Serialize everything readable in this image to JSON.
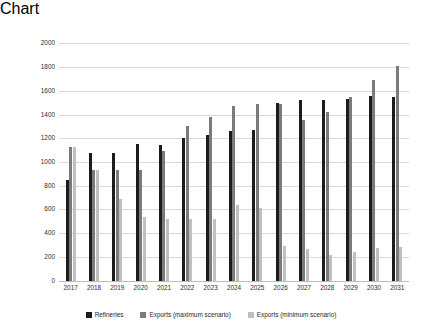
{
  "chart_data": {
    "type": "bar",
    "title": "",
    "subtitle": "",
    "xlabel": "",
    "ylabel": "Thousands of Barrels Per Day",
    "ylim": [
      0,
      2000
    ],
    "ytick_step": 200,
    "yticks": [
      "2000",
      "1800",
      "1600",
      "1400",
      "1200",
      "1000",
      "800",
      "600",
      "400",
      "200",
      "0"
    ],
    "grid": true,
    "legend_position": "bottom",
    "categories": [
      "2017",
      "2018",
      "2019",
      "2020",
      "2021",
      "2022",
      "2023",
      "2024",
      "2025",
      "2026",
      "2027",
      "2028",
      "2029",
      "2030",
      "2031"
    ],
    "series": [
      {
        "name": "Refineries",
        "color": "#1c1c1c",
        "values": [
          850,
          1075,
          1080,
          1150,
          1140,
          1200,
          1230,
          1260,
          1270,
          1500,
          1520,
          1520,
          1530,
          1560,
          1550
        ]
      },
      {
        "name": "Exports (maximum scenario)",
        "color": "#7b7b7b",
        "values": [
          1125,
          935,
          935,
          935,
          1090,
          1300,
          1375,
          1475,
          1490,
          1490,
          1350,
          1420,
          1545,
          1695,
          1805
        ]
      },
      {
        "name": "Exports (minimum scenario)",
        "color": "#c0c0c0",
        "values": [
          1125,
          935,
          685,
          535,
          520,
          520,
          520,
          635,
          610,
          290,
          270,
          215,
          240,
          275,
          280
        ]
      }
    ]
  }
}
